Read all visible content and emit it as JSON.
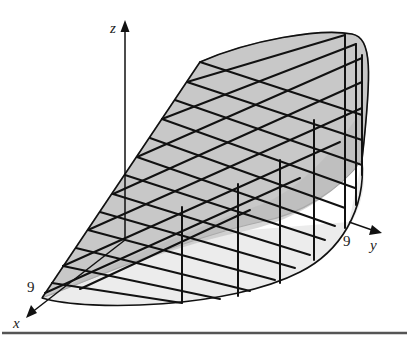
{
  "figure": {
    "axes": {
      "x": {
        "label": "x",
        "tick_label": "9"
      },
      "y": {
        "label": "y",
        "tick_label": "9"
      },
      "z": {
        "label": "z"
      }
    },
    "colors": {
      "top_surface_fill": "#c8c8c8",
      "base_fill": "#ececec",
      "grid_stroke": "#111111",
      "rule": "#555555"
    },
    "geometry": {
      "origin": [
        125,
        240
      ],
      "z_axis_top": [
        125,
        22
      ],
      "x_axis_end": [
        27,
        318
      ],
      "y_axis_end": [
        381,
        233
      ],
      "x9_point": [
        42,
        298
      ],
      "y9_point": [
        349,
        222
      ],
      "top_plane_edge_end": [
        200,
        62
      ],
      "hatch_count": 13,
      "vertical_count": 6
    }
  }
}
